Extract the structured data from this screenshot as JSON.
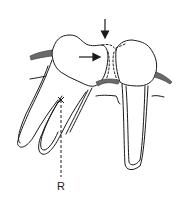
{
  "figure": {
    "type": "dental-diagram",
    "labels": {
      "rotation_center": "R"
    },
    "annotations": [
      {
        "name": "vertical-arrow",
        "direction": "down",
        "meaning": "occlusal force at contact point"
      },
      {
        "name": "horizontal-arrow",
        "direction": "right",
        "meaning": "mesial tipping force on left tooth"
      }
    ],
    "colors": {
      "stroke": "#1a1a1a",
      "gingiva_fill": "#6a6a6a",
      "background": "#ffffff"
    }
  }
}
